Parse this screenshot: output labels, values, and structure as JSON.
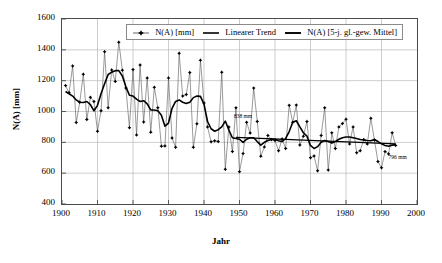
{
  "chart_data": {
    "type": "line",
    "title": "",
    "xlabel": "Jahr",
    "ylabel": "N(A) [mm]",
    "xlim": [
      1900,
      2000
    ],
    "ylim": [
      400,
      1600
    ],
    "xticks": [
      1900,
      1910,
      1920,
      1930,
      1940,
      1950,
      1960,
      1970,
      1980,
      1990,
      2000
    ],
    "yticks": [
      400,
      600,
      800,
      1000,
      1200,
      1400,
      1600
    ],
    "grid": true,
    "legend_position": "top-center",
    "legend": [
      {
        "label": "N(A) [mm]",
        "marker": "line-with-points"
      },
      {
        "label": "Linearer Trend",
        "marker": "line"
      },
      {
        "label": "N(A) [5-j. gl.-gew. Mittel]",
        "marker": "thick-line"
      }
    ],
    "annotations": [
      {
        "text": "838 mm",
        "x": 1949,
        "y": 960
      },
      {
        "text": "796 mm",
        "x": 1992,
        "y": 690
      }
    ],
    "x": [
      1901,
      1902,
      1903,
      1904,
      1905,
      1906,
      1907,
      1908,
      1909,
      1910,
      1911,
      1912,
      1913,
      1914,
      1915,
      1916,
      1917,
      1918,
      1919,
      1920,
      1921,
      1922,
      1923,
      1924,
      1925,
      1926,
      1927,
      1928,
      1929,
      1930,
      1931,
      1932,
      1933,
      1934,
      1935,
      1936,
      1937,
      1938,
      1939,
      1940,
      1941,
      1942,
      1943,
      1944,
      1945,
      1946,
      1947,
      1948,
      1949,
      1950,
      1951,
      1952,
      1953,
      1954,
      1955,
      1956,
      1957,
      1958,
      1959,
      1960,
      1961,
      1962,
      1963,
      1964,
      1965,
      1966,
      1967,
      1968,
      1969,
      1970,
      1971,
      1972,
      1973,
      1974,
      1975,
      1976,
      1977,
      1978,
      1979,
      1980,
      1981,
      1982,
      1983,
      1984,
      1985,
      1986,
      1987,
      1988,
      1989,
      1990,
      1991,
      1992,
      1993,
      1994
    ],
    "series": [
      {
        "name": "N(A) [mm]",
        "values": [
          1168,
          1122,
          1295,
          928,
          1060,
          1242,
          948,
          1092,
          1065,
          872,
          1005,
          1388,
          1024,
          1270,
          1195,
          1450,
          1268,
          1152,
          895,
          1272,
          848,
          1302,
          932,
          1218,
          866,
          1157,
          1024,
          775,
          777,
          1218,
          828,
          768,
          1378,
          1100,
          1110,
          1253,
          768,
          920,
          1333,
          1055,
          900,
          803,
          810,
          805,
          1255,
          625,
          900,
          740,
          1024,
          610,
          727,
          930,
          860,
          1152,
          935,
          710,
          770,
          845,
          818,
          812,
          745,
          822,
          760,
          1040,
          930,
          1042,
          782,
          840,
          935,
          700,
          712,
          615,
          845,
          1024,
          620,
          862,
          760,
          900,
          922,
          950,
          790,
          900,
          732,
          746,
          818,
          790,
          957,
          815,
          675,
          635,
          740,
          725,
          862,
          780
        ]
      },
      {
        "name": "N(A) [5-j. gl.-gew. Mittel]",
        "values": [
          1130,
          1115,
          1100,
          1075,
          1060,
          1058,
          1065,
          1045,
          1005,
          1040,
          1115,
          1180,
          1240,
          1255,
          1265,
          1265,
          1230,
          1160,
          1105,
          1100,
          1080,
          1065,
          1070,
          1050,
          1010,
          1010,
          1005,
          975,
          905,
          925,
          1020,
          1065,
          1075,
          1060,
          1052,
          1060,
          1090,
          1100,
          1098,
          1048,
          935,
          888,
          872,
          882,
          900,
          938,
          880,
          830,
          825,
          820,
          800,
          820,
          830,
          830,
          805,
          782,
          800,
          812,
          818,
          820,
          810,
          805,
          825,
          870,
          930,
          940,
          900,
          862,
          840,
          780,
          760,
          772,
          800,
          812,
          805,
          795,
          805,
          820,
          830,
          835,
          835,
          830,
          825,
          818,
          815,
          812,
          810,
          818,
          805,
          790,
          780,
          775,
          782,
          785
        ]
      }
    ],
    "trend": {
      "name": "Linearer Trend",
      "x": [
        1949,
        1994
      ],
      "y": [
        832,
        790
      ]
    }
  }
}
